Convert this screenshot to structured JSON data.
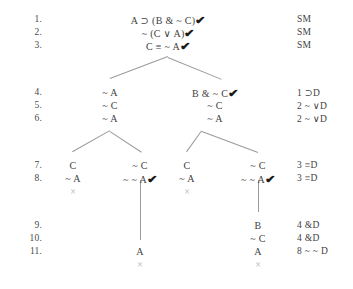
{
  "document": {
    "title": "Truth Tree Proof",
    "text_color": "#3f3f3f",
    "line_color": "#9a9a9a",
    "close_mark_color": "#b4b4b4"
  },
  "line_numbers": [
    {
      "label": "1.",
      "y": 14
    },
    {
      "label": "2.",
      "y": 27
    },
    {
      "label": "3.",
      "y": 40
    },
    {
      "label": "4.",
      "y": 87
    },
    {
      "label": "5.",
      "y": 100
    },
    {
      "label": "6.",
      "y": 113
    },
    {
      "label": "7.",
      "y": 160
    },
    {
      "label": "8.",
      "y": 173
    },
    {
      "label": "9.",
      "y": 220
    },
    {
      "label": "10.",
      "y": 233
    },
    {
      "label": "11.",
      "y": 246
    }
  ],
  "nodes": [
    {
      "text": "A ⊃ (B & ~ C)",
      "check": true,
      "x": 168,
      "y": 14
    },
    {
      "text": "~ (C ∨ A)",
      "check": true,
      "x": 168,
      "y": 27
    },
    {
      "text": "C ≡ ~ A",
      "check": true,
      "x": 168,
      "y": 40
    },
    {
      "text": "~ A",
      "check": false,
      "x": 110,
      "y": 87
    },
    {
      "text": "~ C",
      "check": false,
      "x": 110,
      "y": 100
    },
    {
      "text": "~ A",
      "check": false,
      "x": 110,
      "y": 113
    },
    {
      "text": "B & ~ C",
      "check": true,
      "x": 215,
      "y": 87
    },
    {
      "text": "~ C",
      "check": false,
      "x": 215,
      "y": 100
    },
    {
      "text": "~ A",
      "check": false,
      "x": 215,
      "y": 113
    },
    {
      "text": "C",
      "check": false,
      "x": 73,
      "y": 160
    },
    {
      "text": "~ A",
      "check": false,
      "x": 73,
      "y": 173
    },
    {
      "text": "~ C",
      "check": false,
      "x": 140,
      "y": 160
    },
    {
      "text": "~ ~ A",
      "check": true,
      "x": 140,
      "y": 173
    },
    {
      "text": "C",
      "check": false,
      "x": 187,
      "y": 160
    },
    {
      "text": "~ A",
      "check": false,
      "x": 187,
      "y": 173
    },
    {
      "text": "~ C",
      "check": false,
      "x": 258,
      "y": 160
    },
    {
      "text": "~ ~ A",
      "check": true,
      "x": 258,
      "y": 173
    },
    {
      "text": "B",
      "check": false,
      "x": 258,
      "y": 220
    },
    {
      "text": "~ C",
      "check": false,
      "x": 258,
      "y": 233
    },
    {
      "text": "A",
      "check": false,
      "x": 258,
      "y": 246
    },
    {
      "text": "A",
      "check": false,
      "x": 140,
      "y": 246
    }
  ],
  "justifications": [
    {
      "text": "SM",
      "x": 297,
      "y": 14
    },
    {
      "text": "SM",
      "x": 297,
      "y": 27
    },
    {
      "text": "SM",
      "x": 297,
      "y": 40
    },
    {
      "text": "1 ⊃D",
      "x": 297,
      "y": 87
    },
    {
      "text": "2 ~ ∨D",
      "x": 297,
      "y": 100
    },
    {
      "text": "2 ~ ∨D",
      "x": 297,
      "y": 113
    },
    {
      "text": "3 ≡D",
      "x": 297,
      "y": 160
    },
    {
      "text": "3 ≡D",
      "x": 297,
      "y": 173
    },
    {
      "text": "4 &D",
      "x": 297,
      "y": 220
    },
    {
      "text": "4 &D",
      "x": 297,
      "y": 233
    },
    {
      "text": "8 ~ ~ D",
      "x": 297,
      "y": 246
    }
  ],
  "close_marks": [
    {
      "label": "×",
      "x": 73,
      "y": 186
    },
    {
      "label": "×",
      "x": 187,
      "y": 186
    },
    {
      "label": "×",
      "x": 140,
      "y": 259
    },
    {
      "label": "×",
      "x": 258,
      "y": 259
    }
  ],
  "branches": [
    {
      "x1": 168,
      "y1": 57,
      "x2": 110,
      "y2": 79
    },
    {
      "x1": 168,
      "y1": 57,
      "x2": 222,
      "y2": 79
    },
    {
      "x1": 110,
      "y1": 131,
      "x2": 73,
      "y2": 152
    },
    {
      "x1": 110,
      "y1": 131,
      "x2": 142,
      "y2": 152
    },
    {
      "x1": 202,
      "y1": 131,
      "x2": 187,
      "y2": 152
    },
    {
      "x1": 202,
      "y1": 131,
      "x2": 258,
      "y2": 152
    }
  ],
  "verticals": [
    {
      "x": 140,
      "y1": 180,
      "y2": 240
    },
    {
      "x": 258,
      "y1": 180,
      "y2": 212
    }
  ],
  "check_glyph": "✔"
}
